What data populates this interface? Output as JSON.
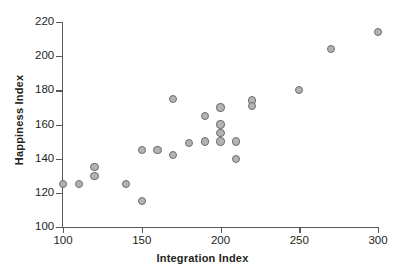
{
  "chart_data": {
    "type": "scatter",
    "title": "",
    "xlabel": "Integration Index",
    "ylabel": "Happiness Index",
    "xlim": [
      100,
      300
    ],
    "ylim": [
      100,
      220
    ],
    "xticks": [
      100,
      150,
      200,
      250,
      300
    ],
    "yticks": [
      100,
      120,
      140,
      160,
      180,
      200,
      220
    ],
    "grid": false,
    "legend": null,
    "marker": {
      "shape": "circle",
      "fill_color": "#b3b3b3",
      "edge_color": "#6d6e71",
      "size_px": 8
    },
    "series": [
      {
        "name": "observations",
        "points": [
          {
            "x": 100,
            "y": 125
          },
          {
            "x": 110,
            "y": 125
          },
          {
            "x": 120,
            "y": 135
          },
          {
            "x": 120,
            "y": 130
          },
          {
            "x": 140,
            "y": 125
          },
          {
            "x": 150,
            "y": 115
          },
          {
            "x": 150,
            "y": 145
          },
          {
            "x": 160,
            "y": 145
          },
          {
            "x": 170,
            "y": 142
          },
          {
            "x": 170,
            "y": 175
          },
          {
            "x": 180,
            "y": 149
          },
          {
            "x": 190,
            "y": 150
          },
          {
            "x": 190,
            "y": 165
          },
          {
            "x": 200,
            "y": 170
          },
          {
            "x": 200,
            "y": 160
          },
          {
            "x": 200,
            "y": 155
          },
          {
            "x": 200,
            "y": 150
          },
          {
            "x": 210,
            "y": 150
          },
          {
            "x": 210,
            "y": 140
          },
          {
            "x": 220,
            "y": 174
          },
          {
            "x": 220,
            "y": 171
          },
          {
            "x": 250,
            "y": 180
          },
          {
            "x": 270,
            "y": 204
          },
          {
            "x": 300,
            "y": 214
          }
        ]
      }
    ]
  }
}
